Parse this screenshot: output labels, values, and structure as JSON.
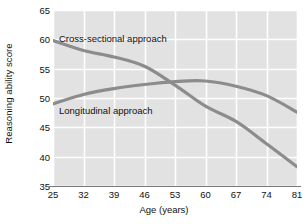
{
  "chart_data": {
    "type": "line",
    "title": "",
    "xlabel": "Age (years)",
    "ylabel": "Reasoning ability score",
    "xlim": [
      25,
      81
    ],
    "ylim": [
      35,
      65
    ],
    "xticks": [
      25,
      32,
      39,
      46,
      53,
      60,
      67,
      74,
      81
    ],
    "yticks": [
      35,
      40,
      45,
      50,
      55,
      60,
      65
    ],
    "grid": true,
    "legend_position": "inline-annotation",
    "plot_background": "#e2e2e2",
    "gridline_color": "#ffffff",
    "series_color": "#8c8c8c",
    "x": [
      25,
      32,
      39,
      46,
      53,
      60,
      67,
      74,
      81
    ],
    "series": [
      {
        "name": "Cross-sectional approach",
        "values": [
          59.8,
          58.1,
          57.0,
          55.4,
          52.2,
          48.6,
          46.0,
          42.2,
          38.3
        ]
      },
      {
        "name": "Longitudinal approach",
        "values": [
          49.0,
          50.6,
          51.6,
          52.3,
          52.8,
          52.9,
          52.0,
          50.4,
          47.6
        ]
      }
    ],
    "annotations": [
      {
        "text": "Cross-sectional approach",
        "x": 26.5,
        "y": 61.6
      },
      {
        "text": "Longitudinal approach",
        "x": 26.5,
        "y": 48.2
      }
    ]
  }
}
